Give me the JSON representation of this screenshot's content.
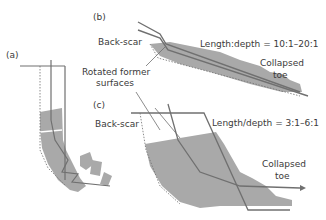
{
  "panels": {
    "a": {
      "label": "(a)"
    },
    "b": {
      "label": "(b)",
      "back_scar": "Back-scar",
      "ratio": "Length:depth = 10:1–20:1",
      "toe": [
        "Collapsed",
        "toe"
      ]
    },
    "c": {
      "label": "(c)",
      "back_scar": "Back-scar",
      "ratio": "Length/depth = 3:1–6:1",
      "toe": [
        "Collapsed",
        "toe"
      ]
    }
  },
  "shared": {
    "rotated": [
      "Rotated former",
      "surfaces"
    ]
  },
  "colors": {
    "fill": "#a9a9a9",
    "line": "#707070",
    "text": "#3a3a3a"
  }
}
